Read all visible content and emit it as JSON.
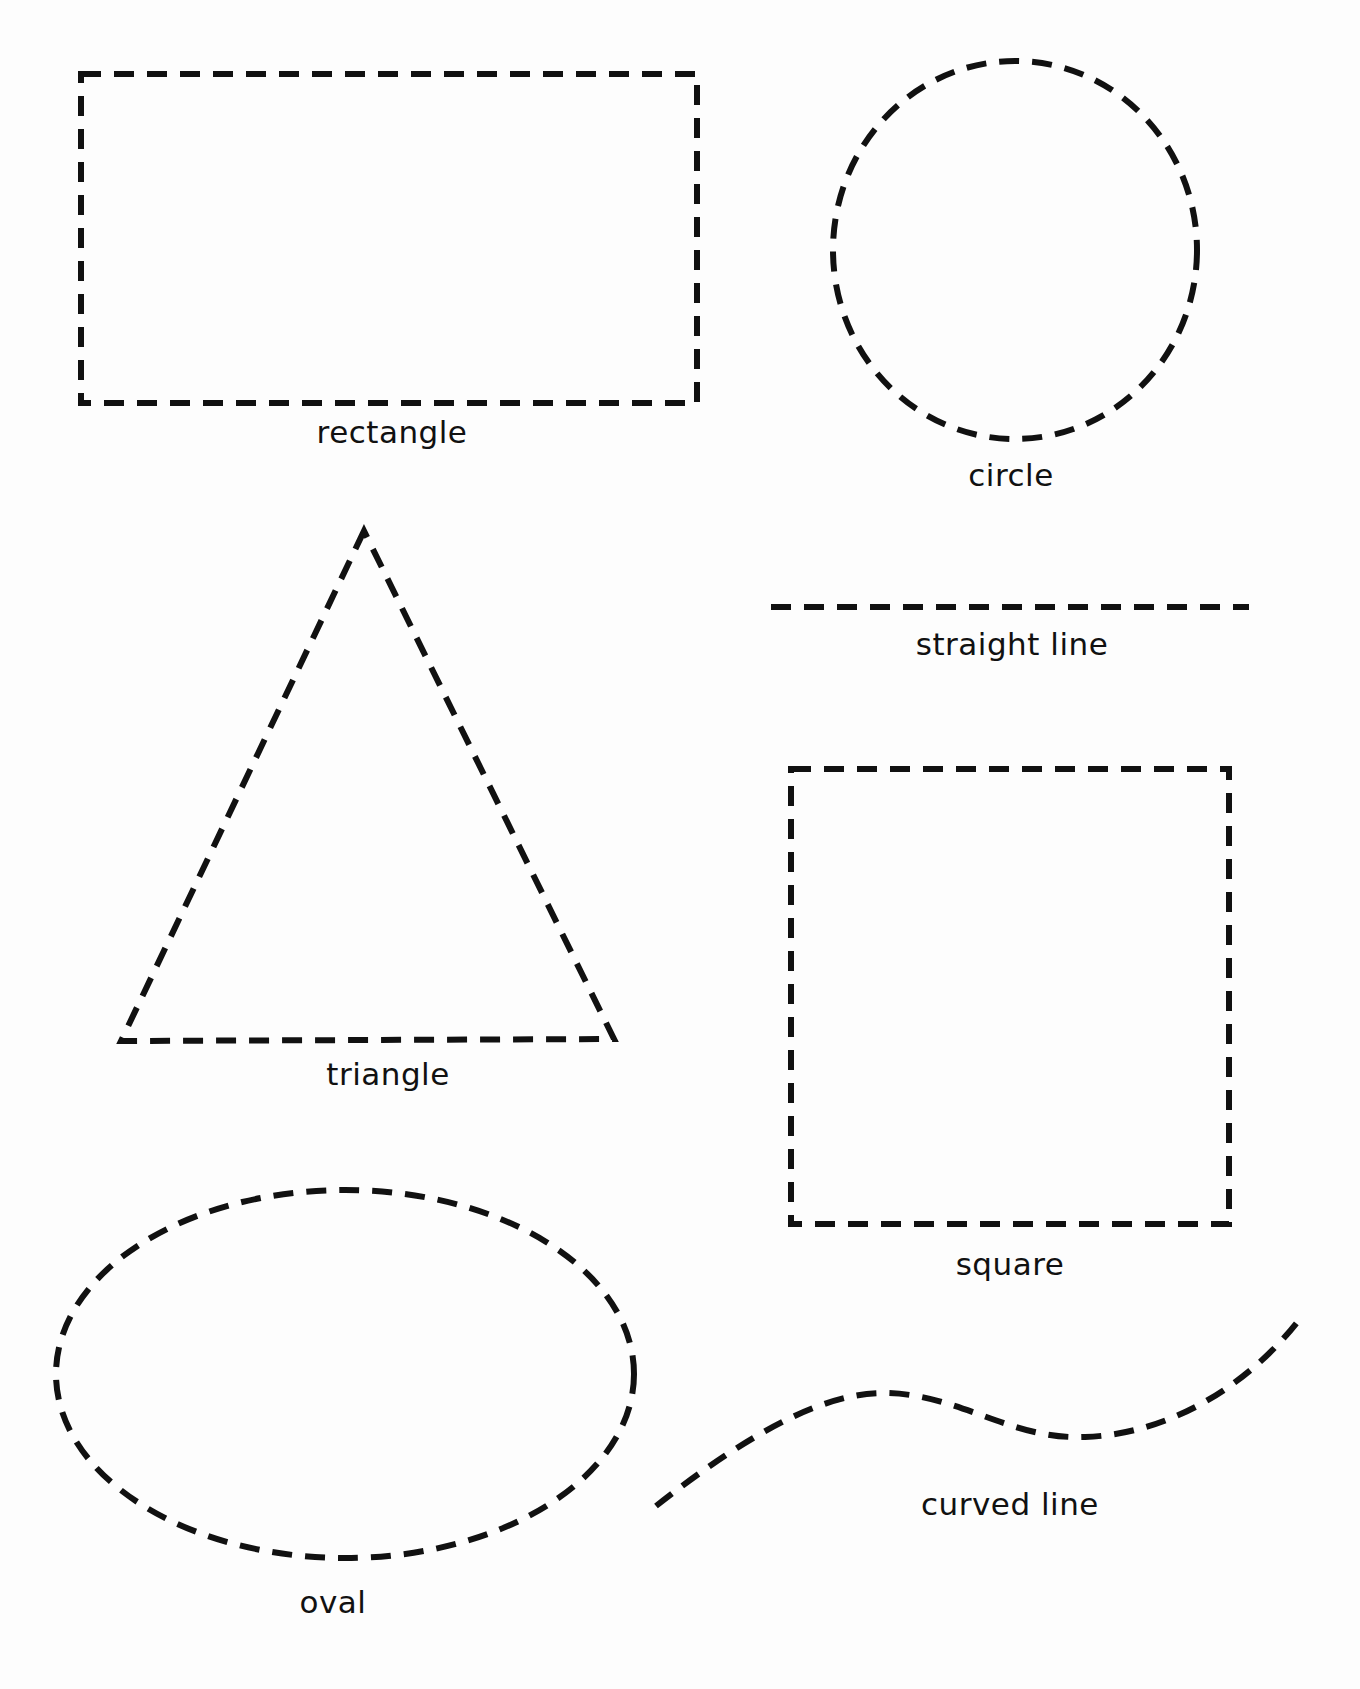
{
  "worksheet": {
    "ink_color": "#111111",
    "paper_color": "#fdfdfd",
    "shapes": [
      {
        "id": "rectangle",
        "label": "rectangle",
        "type": "rect",
        "x": 81,
        "y": 74,
        "w": 616,
        "h": 329,
        "label_x": 392,
        "label_y": 433
      },
      {
        "id": "circle",
        "label": "circle",
        "type": "ellipse",
        "cx": 1015,
        "cy": 250,
        "rx": 182,
        "ry": 189,
        "label_x": 1011,
        "label_y": 476
      },
      {
        "id": "triangle",
        "label": "triangle",
        "type": "polygon",
        "points": "364,531 121,1041 614,1039",
        "label_x": 388,
        "label_y": 1075
      },
      {
        "id": "straight-line",
        "label": "straight line",
        "type": "line",
        "x1": 771,
        "y1": 607,
        "x2": 1249,
        "y2": 607,
        "label_x": 1012,
        "label_y": 645
      },
      {
        "id": "square",
        "label": "square",
        "type": "rect",
        "x": 791,
        "y": 769,
        "w": 438,
        "h": 455,
        "label_x": 1010,
        "label_y": 1265
      },
      {
        "id": "oval",
        "label": "oval",
        "type": "ellipse",
        "cx": 345,
        "cy": 1374,
        "rx": 289,
        "ry": 184,
        "label_x": 333,
        "label_y": 1603
      },
      {
        "id": "curved-line",
        "label": "curved line",
        "type": "path",
        "d": "M 656 1506 C 740 1440, 820 1392, 885 1393 C 960 1394, 1010 1440, 1085 1437 C 1170 1434, 1250 1385, 1302 1316",
        "label_x": 1010,
        "label_y": 1505
      }
    ]
  }
}
